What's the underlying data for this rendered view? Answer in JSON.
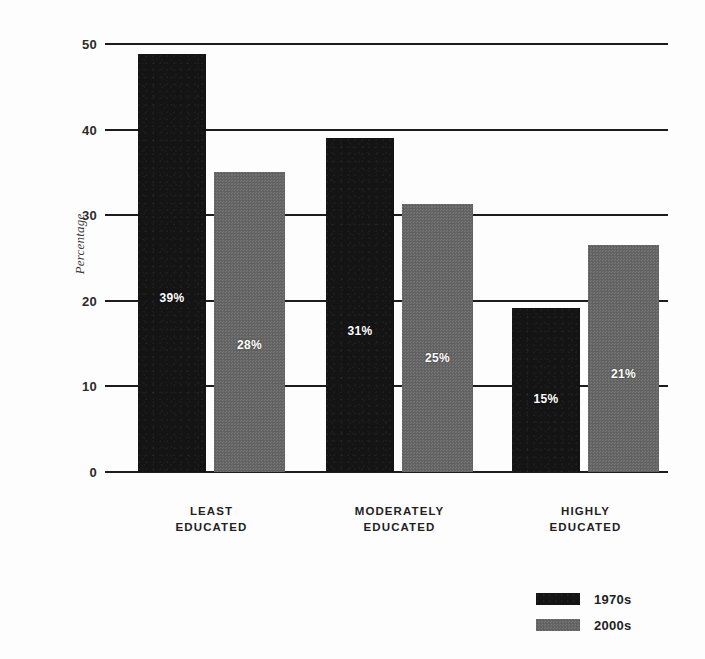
{
  "chart_data": {
    "type": "bar",
    "title": "",
    "xlabel": "",
    "ylabel": "Percentage",
    "ylim": [
      0,
      50
    ],
    "yticks": [
      0,
      10,
      20,
      30,
      40,
      50
    ],
    "ytick_labels": [
      "0",
      "10",
      "20",
      "30",
      "40",
      "50"
    ],
    "grid": true,
    "legend_position": "bottom-right",
    "categories": [
      "LEAST EDUCATED",
      "MODERATELY EDUCATED",
      "HIGHLY EDUCATED"
    ],
    "category_lines": [
      [
        "LEAST",
        "EDUCATED"
      ],
      [
        "MODERATELY",
        "EDUCATED"
      ],
      [
        "HIGHLY",
        "EDUCATED"
      ]
    ],
    "series": [
      {
        "name": "1970s",
        "color": "#141414",
        "values": [
          48.8,
          39.0,
          19.2
        ],
        "labels": [
          "39%",
          "31%",
          "15%"
        ]
      },
      {
        "name": "2000s",
        "color": "#666666",
        "values": [
          35.1,
          31.3,
          26.5
        ],
        "labels": [
          "28%",
          "25%",
          "21%"
        ]
      }
    ]
  },
  "axis": {
    "y_label": "Percentage"
  },
  "legend": {
    "items": [
      {
        "label": "1970s",
        "color": "#141414"
      },
      {
        "label": "2000s",
        "color": "#666666"
      }
    ]
  }
}
